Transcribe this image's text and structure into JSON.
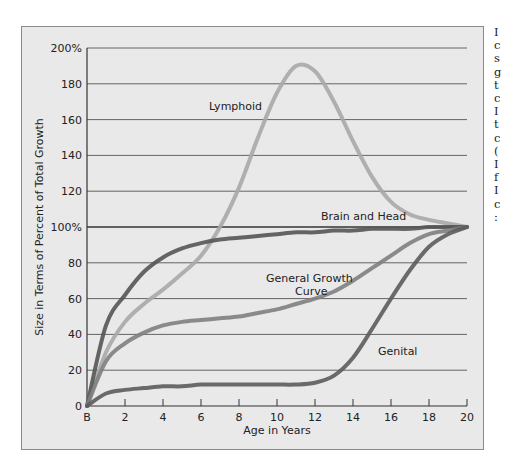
{
  "chart_data": {
    "type": "line",
    "title": "",
    "xlabel": "Age in Years",
    "ylabel": "Size in Terms of Percent of Total Growth",
    "x_ticks": [
      "B",
      "2",
      "4",
      "6",
      "8",
      "10",
      "12",
      "14",
      "16",
      "18",
      "20"
    ],
    "y_ticks": [
      "0",
      "20",
      "40",
      "60",
      "80",
      "100%",
      "120",
      "140",
      "160",
      "180",
      "200%"
    ],
    "xlim": [
      0,
      20
    ],
    "ylim": [
      0,
      200
    ],
    "grid": "horizontal",
    "x": [
      0,
      1,
      2,
      3,
      4,
      5,
      6,
      7,
      8,
      9,
      10,
      11,
      12,
      13,
      14,
      15,
      16,
      17,
      18,
      19,
      20
    ],
    "series": [
      {
        "name": "Lymphoid",
        "color": "#a8a8a8",
        "values": [
          0,
          30,
          47,
          57,
          65,
          74,
          84,
          100,
          122,
          150,
          175,
          190,
          187,
          170,
          148,
          128,
          114,
          107,
          104,
          102,
          100
        ]
      },
      {
        "name": "Brain and Head",
        "color": "#555555",
        "values": [
          0,
          45,
          62,
          75,
          83,
          88,
          91,
          93,
          94,
          95,
          96,
          97,
          97,
          98,
          98,
          99,
          99,
          99,
          100,
          100,
          100
        ]
      },
      {
        "name": "General Growth Curve",
        "color": "#808080",
        "values": [
          0,
          25,
          35,
          41,
          45,
          47,
          48,
          49,
          50,
          52,
          54,
          57,
          60,
          64,
          70,
          77,
          84,
          91,
          96,
          98,
          100
        ]
      },
      {
        "name": "Genital",
        "color": "#5c5c5c",
        "values": [
          0,
          7,
          9,
          10,
          11,
          11,
          12,
          12,
          12,
          12,
          12,
          12,
          13,
          17,
          27,
          43,
          60,
          76,
          89,
          96,
          100
        ]
      }
    ],
    "annotations": [
      {
        "text": "Lymphoid",
        "x": 8,
        "y": 165
      },
      {
        "text": "Brain and Head",
        "x": 14.5,
        "y": 108
      },
      {
        "text": "General Growth",
        "x": 12,
        "y": 70
      },
      {
        "text": "Curve",
        "x": 12,
        "y": 63
      },
      {
        "text": "Genital",
        "x": 17,
        "y": 33
      }
    ],
    "legend": "none (inline labels)"
  },
  "labels": {
    "xlabel": "Age in Years",
    "ylabel": "Size in Terms of Percent of Total Growth",
    "lymphoid": "Lymphoid",
    "brain": "Brain and Head",
    "general1": "General Growth",
    "general2": "Curve",
    "genital": "Genital"
  },
  "side_text": "I\nc\ns\ng\nt\nc\nI\nt\nc\n(\nI\nf\nI\nc\n:"
}
